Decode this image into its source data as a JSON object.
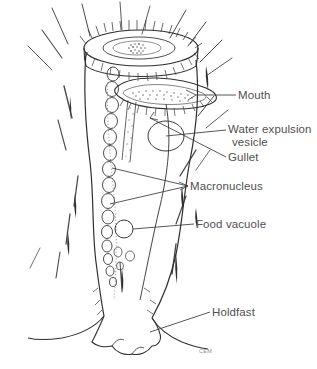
{
  "figure": {
    "background_color": "#ffffff",
    "ink_color": "#3a3a3a",
    "label_color": "#4f4f4f",
    "stipple_color": "#6e6e6e"
  },
  "labels": {
    "mouth": "Mouth",
    "water_expulsion_vesicle_line1": "Water expulsion",
    "water_expulsion_vesicle_line2": "vesicle",
    "gullet": "Gullet",
    "macronucleus": "Macronucleus",
    "food_vacuole": "Food vacuole",
    "holdfast": "Holdfast"
  },
  "credit": {
    "signature": "CEM"
  },
  "parts": [
    {
      "name": "mouth",
      "label": "Mouth"
    },
    {
      "name": "water-expulsion-vesicle",
      "label": "Water expulsion vesicle"
    },
    {
      "name": "gullet",
      "label": "Gullet"
    },
    {
      "name": "macronucleus",
      "label": "Macronucleus"
    },
    {
      "name": "food-vacuole",
      "label": "Food vacuole"
    },
    {
      "name": "holdfast",
      "label": "Holdfast"
    }
  ]
}
